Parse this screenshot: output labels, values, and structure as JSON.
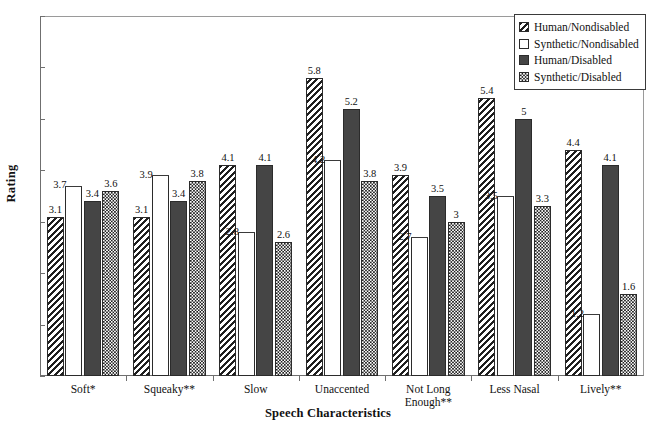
{
  "chart_data": {
    "type": "bar",
    "title": "",
    "xlabel": "Speech Characteristics",
    "ylabel": "Rating",
    "ylim": [
      0,
      7
    ],
    "yticks": [
      0,
      1,
      2,
      3,
      4,
      5,
      6,
      7
    ],
    "grid": false,
    "legend_position": "top-right",
    "categories": [
      "Soft*",
      "Squeaky**",
      "Slow",
      "Unaccented",
      "Not Long\nEnough**",
      "Less Nasal",
      "Lively**"
    ],
    "series": [
      {
        "name": "Human/Nondisabled",
        "pattern": "diagonal-hatch",
        "values": [
          3.1,
          3.1,
          4.1,
          5.8,
          3.9,
          5.4,
          4.4
        ],
        "labels": [
          "3.1",
          "3.1",
          "4.1",
          "5.8",
          "3.9",
          "5.4",
          "4.4"
        ]
      },
      {
        "name": "Synthetic/Nondisabled",
        "pattern": "open-white",
        "values": [
          3.7,
          3.9,
          2.8,
          4.2,
          2.7,
          3.5,
          1.2
        ],
        "labels": [
          "3.7",
          "3.9",
          "2.8",
          "4.2",
          "2.7",
          "3.5",
          "1.2"
        ]
      },
      {
        "name": "Human/Disabled",
        "pattern": "solid-dark",
        "values": [
          3.4,
          3.4,
          4.1,
          5.2,
          3.5,
          5.0,
          4.1
        ],
        "labels": [
          "3.4",
          "3.4",
          "4.1",
          "5.2",
          "3.5",
          "5",
          "4.1"
        ]
      },
      {
        "name": "Synthetic/Disabled",
        "pattern": "checkerboard",
        "values": [
          3.6,
          3.8,
          2.6,
          3.8,
          3.0,
          3.3,
          1.6
        ],
        "labels": [
          "3.6",
          "3.8",
          "2.6",
          "3.8",
          "3",
          "3.3",
          "1.6"
        ]
      }
    ]
  },
  "legend": {
    "items": [
      {
        "label": "Human/Nondisabled",
        "swatch": "diagonal-hatch-swatch"
      },
      {
        "label": "Synthetic/Nondisabled",
        "swatch": "open-white-swatch"
      },
      {
        "label": "Human/Disabled",
        "swatch": "solid-dark-swatch"
      },
      {
        "label": "Synthetic/Disabled",
        "swatch": "checkerboard-swatch"
      }
    ]
  },
  "colors": {
    "solid_bar": "#454545",
    "hatch_line": "#1f1f1f",
    "axis": "#6f6f6f",
    "text": "#111111",
    "background": "#ffffff"
  }
}
